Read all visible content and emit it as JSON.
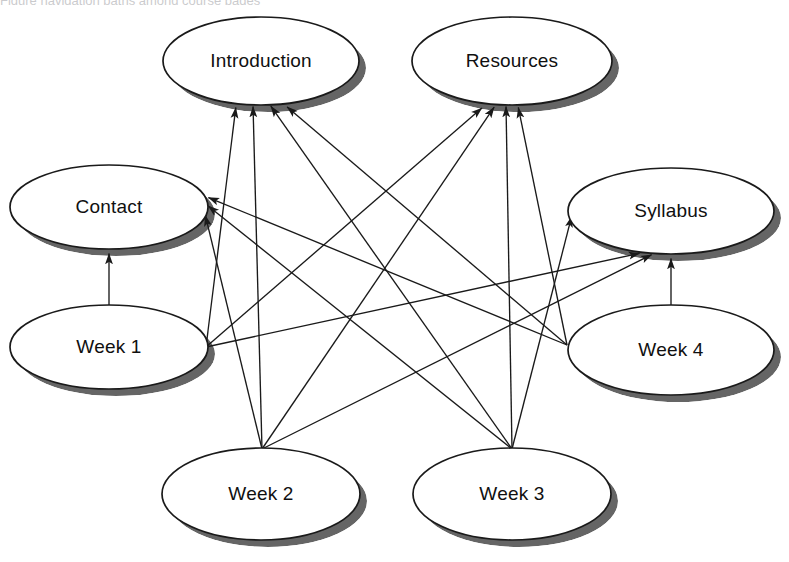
{
  "diagram": {
    "type": "directed-graph",
    "title_fragment_clipped": "Figure   navigation paths among course pages",
    "background_color": "#ffffff",
    "node_fill": "#ffffff",
    "node_stroke": "#1a1a1a",
    "shadow_color": "#4a4a4a",
    "edge_color": "#1a1a1a",
    "node_shape": "ellipse",
    "nodes": [
      {
        "id": "introduction",
        "label": "Introduction",
        "cx": 261,
        "cy": 61,
        "rx": 98,
        "ry": 44
      },
      {
        "id": "resources",
        "label": "Resources",
        "cx": 512,
        "cy": 61,
        "rx": 100,
        "ry": 44
      },
      {
        "id": "contact",
        "label": "Contact",
        "cx": 109,
        "cy": 207,
        "rx": 99,
        "ry": 42
      },
      {
        "id": "syllabus",
        "label": "Syllabus",
        "cx": 671,
        "cy": 211,
        "rx": 103,
        "ry": 43
      },
      {
        "id": "week1",
        "label": "Week 1",
        "cx": 109,
        "cy": 347,
        "rx": 99,
        "ry": 42
      },
      {
        "id": "week4",
        "label": "Week 4",
        "cx": 671,
        "cy": 350,
        "rx": 103,
        "ry": 45
      },
      {
        "id": "week2",
        "label": "Week 2",
        "cx": 261,
        "cy": 494,
        "rx": 99,
        "ry": 46
      },
      {
        "id": "week3",
        "label": "Week 3",
        "cx": 512,
        "cy": 494,
        "rx": 99,
        "ry": 46
      }
    ],
    "edges": [
      {
        "from": "week1",
        "to": "contact",
        "x1": 109,
        "y1": 305,
        "x2": 109,
        "y2": 252
      },
      {
        "from": "week1",
        "to": "introduction",
        "x1": 206,
        "y1": 347,
        "x2": 236,
        "y2": 106
      },
      {
        "from": "week1",
        "to": "resources",
        "x1": 206,
        "y1": 347,
        "x2": 483,
        "y2": 107
      },
      {
        "from": "week1",
        "to": "syllabus",
        "x1": 206,
        "y1": 347,
        "x2": 641,
        "y2": 253
      },
      {
        "from": "week2",
        "to": "introduction",
        "x1": 262,
        "y1": 449,
        "x2": 253,
        "y2": 105
      },
      {
        "from": "week2",
        "to": "resources",
        "x1": 262,
        "y1": 449,
        "x2": 495,
        "y2": 106
      },
      {
        "from": "week2",
        "to": "contact",
        "x1": 262,
        "y1": 449,
        "x2": 205,
        "y2": 214
      },
      {
        "from": "week2",
        "to": "syllabus",
        "x1": 262,
        "y1": 449,
        "x2": 653,
        "y2": 254
      },
      {
        "from": "week3",
        "to": "introduction",
        "x1": 512,
        "y1": 449,
        "x2": 270,
        "y2": 105
      },
      {
        "from": "week3",
        "to": "resources",
        "x1": 512,
        "y1": 449,
        "x2": 506,
        "y2": 105
      },
      {
        "from": "week3",
        "to": "contact",
        "x1": 512,
        "y1": 449,
        "x2": 207,
        "y2": 205
      },
      {
        "from": "week3",
        "to": "syllabus",
        "x1": 512,
        "y1": 449,
        "x2": 572,
        "y2": 215
      },
      {
        "from": "week4",
        "to": "syllabus",
        "x1": 671,
        "y1": 307,
        "x2": 671,
        "y2": 257
      },
      {
        "from": "week4",
        "to": "introduction",
        "x1": 567,
        "y1": 345,
        "x2": 286,
        "y2": 106
      },
      {
        "from": "week4",
        "to": "resources",
        "x1": 567,
        "y1": 345,
        "x2": 518,
        "y2": 106
      },
      {
        "from": "week4",
        "to": "contact",
        "x1": 567,
        "y1": 345,
        "x2": 207,
        "y2": 197
      }
    ],
    "edge_count": 16,
    "node_count": 8
  }
}
